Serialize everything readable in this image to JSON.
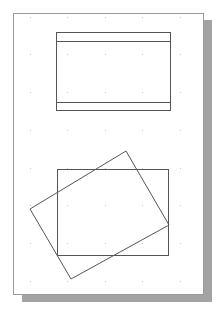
{
  "canvas": {
    "width": 218,
    "height": 309,
    "background": "#ffffff"
  },
  "colors": {
    "page_fill": "#ffffff",
    "page_border": "#9a9a9a",
    "shadow": "#a3a3a3",
    "shape_stroke": "#555555",
    "grid_dot": "#c8c8c8"
  },
  "page": {
    "x": 13,
    "y": 13,
    "width": 190,
    "height": 281
  },
  "shadow": {
    "x": 22,
    "y": 20,
    "width": 190,
    "height": 282
  },
  "grid": {
    "xs": [
      30,
      67,
      105,
      142,
      180
    ],
    "ys": [
      17,
      54,
      92,
      130,
      168,
      205,
      243,
      281
    ]
  },
  "shapes": {
    "top_rectangle": {
      "x": 56,
      "y": 32,
      "width": 114,
      "height": 78,
      "top_band_line_y": 41,
      "bottom_band_line_y": 102
    },
    "bottom_rectangle": {
      "x": 57,
      "y": 169,
      "width": 111,
      "height": 86
    },
    "rotated_rectangle": {
      "points": [
        [
          126,
          151
        ],
        [
          169,
          225
        ],
        [
          71,
          279
        ],
        [
          30,
          209
        ]
      ]
    }
  }
}
